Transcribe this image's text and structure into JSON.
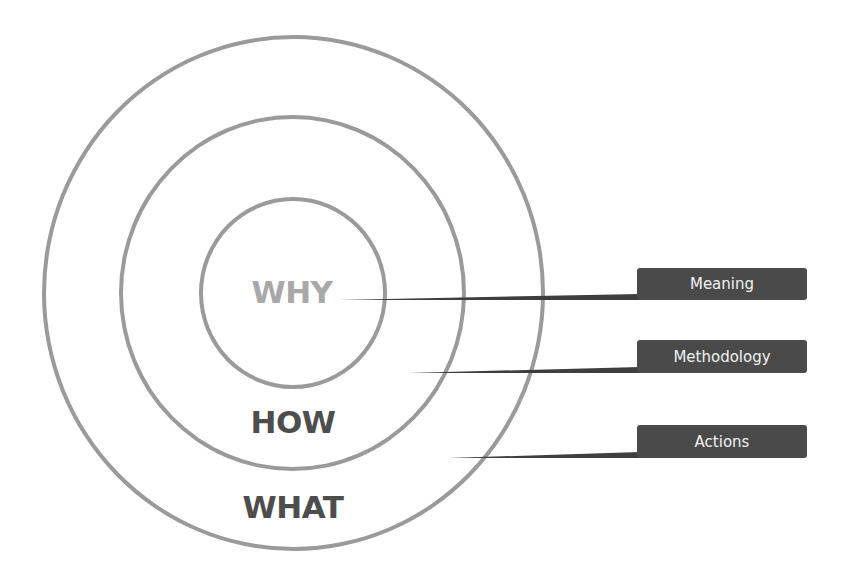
{
  "diagram": {
    "rings": [
      {
        "id": "why",
        "label": "WHY",
        "color": "#a8a8a8"
      },
      {
        "id": "how",
        "label": "HOW",
        "color": "#4d4d4d"
      },
      {
        "id": "what",
        "label": "WHAT",
        "color": "#4d4d4d"
      }
    ],
    "callouts": [
      {
        "label": "Meaning",
        "points_to": "WHY"
      },
      {
        "label": "Methodology",
        "points_to": "HOW"
      },
      {
        "label": "Actions",
        "points_to": "WHAT"
      }
    ],
    "colors": {
      "ring_stroke": "#9a9a9a",
      "tag_background": "#4a4a4a",
      "tag_text": "#f2f2f2",
      "leader_line": "#3e3e3e"
    }
  }
}
